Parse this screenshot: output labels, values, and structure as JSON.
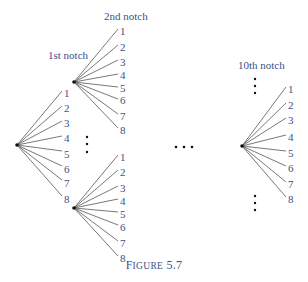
{
  "figure": {
    "caption_prefix": "F",
    "caption_rest": "IGURE",
    "caption_number": "5.7",
    "caption_full": "FIGURE 5.7"
  },
  "colors": {
    "label": "#3d4f8a",
    "edge": "#555555",
    "node": "#111111"
  },
  "headers": {
    "first": "1st notch",
    "second": "2nd notch",
    "tenth": "10th notch"
  },
  "root": {
    "labels": [
      "1",
      "2",
      "3",
      "4",
      "5",
      "6",
      "7",
      "8"
    ]
  },
  "upper_subtree": {
    "labels": [
      "1",
      "2",
      "3",
      "4",
      "5",
      "6",
      "7",
      "8"
    ]
  },
  "lower_subtree": {
    "labels": [
      "1",
      "2",
      "3",
      "4",
      "5",
      "6",
      "7",
      "8"
    ]
  },
  "tenth_subtree": {
    "labels": [
      "1",
      "2",
      "3",
      "4",
      "5",
      "6",
      "7",
      "8"
    ]
  }
}
